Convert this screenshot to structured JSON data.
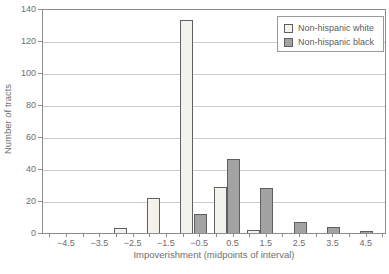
{
  "figure": {
    "width_px": 389,
    "height_px": 274
  },
  "legend": {
    "position": "top-right"
  },
  "chart_data": {
    "type": "bar",
    "subtype": "paired-histogram",
    "title": "",
    "xlabel": "Impoverishment (midpoints of interval)",
    "ylabel": "Number of tracts",
    "categories": [
      -4.5,
      -3.5,
      -2.5,
      -1.5,
      -0.5,
      0.5,
      1.5,
      2.5,
      3.5,
      4.5
    ],
    "series": [
      {
        "name": "Non-hispanic white",
        "color": "#f3f2ed",
        "values": [
          0,
          0,
          3,
          22,
          133,
          29,
          2,
          0,
          0,
          0
        ]
      },
      {
        "name": "Non-hispanic black",
        "color": "#a3a3a3",
        "values": [
          0,
          0,
          0,
          0,
          12,
          46,
          28,
          7,
          4,
          1
        ]
      }
    ],
    "ylim": [
      0,
      140
    ],
    "ytick_step": 20,
    "yticks": [
      0,
      20,
      40,
      60,
      80,
      100,
      120,
      140
    ],
    "grid": true,
    "legend_position": "top-right",
    "colors": {
      "bar_border": "#5f5f5f",
      "gridline": "#cccccc",
      "frame": "#8c8c8c",
      "text": "#6e6e6e"
    }
  }
}
